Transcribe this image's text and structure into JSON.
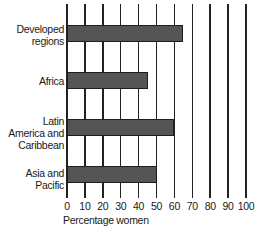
{
  "chart_data": {
    "type": "bar",
    "orientation": "horizontal",
    "title": "",
    "xlabel": "Percentage women",
    "ylabel": "",
    "categories": [
      "Developed regions",
      "Africa",
      "Latin America and Caribbean",
      "Asia and Pacific"
    ],
    "values": [
      65,
      45,
      60,
      50
    ],
    "xlim": [
      0,
      100
    ],
    "xticks": [
      0,
      10,
      20,
      30,
      40,
      50,
      60,
      70,
      80,
      90,
      100
    ],
    "grid": true,
    "legend": null,
    "bar_color": "#555555"
  },
  "labels": {
    "cat0": "Developed\nregions",
    "cat1": "Africa",
    "cat2": "Latin\nAmerica and\nCaribbean",
    "cat3": "Asia and\nPacific"
  },
  "ticks": [
    "0",
    "10",
    "20",
    "30",
    "40",
    "50",
    "60",
    "70",
    "80",
    "90",
    "100"
  ]
}
